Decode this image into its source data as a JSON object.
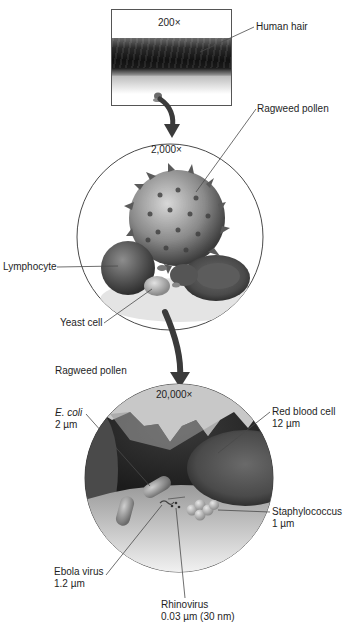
{
  "figure": {
    "panels": [
      {
        "id": "panel-200x",
        "magnification": "200×",
        "labels": [
          {
            "text": "Human hair"
          }
        ]
      },
      {
        "id": "panel-2000x",
        "magnification": "2,000×",
        "labels": [
          {
            "text": "Ragweed pollen"
          },
          {
            "text": "Lymphocyte"
          },
          {
            "text": "Yeast cell"
          }
        ]
      },
      {
        "id": "panel-20000x",
        "magnification": "20,000×",
        "labels": [
          {
            "text": "Ragweed pollen"
          },
          {
            "text": "E. coli",
            "size": "2 µm"
          },
          {
            "text": "Red blood cell",
            "size": "12 µm"
          },
          {
            "text": "Staphylococcus",
            "size": "1 µm"
          },
          {
            "text": "Ebola virus",
            "size": "1.2 µm"
          },
          {
            "text": "Rhinovirus",
            "size": "0.03 µm (30 nm)"
          }
        ]
      }
    ]
  },
  "colors": {
    "line": "#4a4a4a",
    "arrow": "#3a3a3a",
    "text": "#1e1e1e"
  }
}
